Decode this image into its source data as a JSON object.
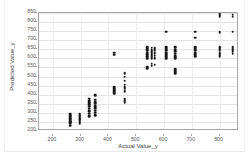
{
  "chart_data": {
    "type": "scatter",
    "title": "",
    "xlabel": "Actual Value_y",
    "ylabel": "Predicted Value_y",
    "xlim": [
      150,
      870
    ],
    "ylim": [
      200,
      850
    ],
    "xticks": [
      200,
      300,
      400,
      500,
      600,
      700,
      800
    ],
    "yticks": [
      200,
      250,
      300,
      350,
      400,
      450,
      500,
      550,
      600,
      650,
      700,
      750,
      800,
      850
    ],
    "grid": true,
    "legend": null,
    "marker": "filled-circle",
    "marker_color": "#181818",
    "points": [
      [
        262,
        230
      ],
      [
        262,
        240
      ],
      [
        262,
        248
      ],
      [
        262,
        255
      ],
      [
        262,
        262
      ],
      [
        262,
        270
      ],
      [
        262,
        278
      ],
      [
        262,
        285
      ],
      [
        262,
        292
      ],
      [
        297,
        240
      ],
      [
        297,
        250
      ],
      [
        297,
        258
      ],
      [
        297,
        265
      ],
      [
        297,
        272
      ],
      [
        297,
        280
      ],
      [
        297,
        288
      ],
      [
        297,
        295
      ],
      [
        331,
        280
      ],
      [
        331,
        295
      ],
      [
        331,
        310
      ],
      [
        331,
        322
      ],
      [
        331,
        335
      ],
      [
        331,
        348
      ],
      [
        331,
        358
      ],
      [
        331,
        368
      ],
      [
        331,
        378
      ],
      [
        352,
        288
      ],
      [
        352,
        300
      ],
      [
        352,
        312
      ],
      [
        352,
        325
      ],
      [
        352,
        338
      ],
      [
        352,
        350
      ],
      [
        352,
        360
      ],
      [
        352,
        372
      ],
      [
        352,
        398
      ],
      [
        421,
        405
      ],
      [
        421,
        415
      ],
      [
        421,
        425
      ],
      [
        421,
        432
      ],
      [
        421,
        440
      ],
      [
        421,
        620
      ],
      [
        421,
        632
      ],
      [
        458,
        355
      ],
      [
        458,
        365
      ],
      [
        458,
        375
      ],
      [
        458,
        420
      ],
      [
        458,
        432
      ],
      [
        458,
        442
      ],
      [
        458,
        455
      ],
      [
        458,
        478
      ],
      [
        458,
        498
      ],
      [
        458,
        518
      ],
      [
        540,
        545
      ],
      [
        540,
        555
      ],
      [
        540,
        600
      ],
      [
        540,
        612
      ],
      [
        540,
        622
      ],
      [
        540,
        632
      ],
      [
        540,
        642
      ],
      [
        540,
        652
      ],
      [
        540,
        660
      ],
      [
        556,
        560
      ],
      [
        556,
        570
      ],
      [
        556,
        598
      ],
      [
        556,
        608
      ],
      [
        556,
        618
      ],
      [
        556,
        628
      ],
      [
        556,
        638
      ],
      [
        556,
        648
      ],
      [
        556,
        658
      ],
      [
        567,
        565
      ],
      [
        567,
        600
      ],
      [
        567,
        615
      ],
      [
        567,
        630
      ],
      [
        567,
        645
      ],
      [
        567,
        655
      ],
      [
        608,
        600
      ],
      [
        608,
        612
      ],
      [
        608,
        622
      ],
      [
        608,
        632
      ],
      [
        608,
        642
      ],
      [
        608,
        652
      ],
      [
        608,
        660
      ],
      [
        608,
        748
      ],
      [
        640,
        518
      ],
      [
        640,
        530
      ],
      [
        640,
        540
      ],
      [
        640,
        600
      ],
      [
        640,
        612
      ],
      [
        640,
        625
      ],
      [
        640,
        638
      ],
      [
        640,
        648
      ],
      [
        640,
        658
      ],
      [
        640,
        665
      ],
      [
        712,
        612
      ],
      [
        712,
        622
      ],
      [
        712,
        632
      ],
      [
        712,
        642
      ],
      [
        712,
        652
      ],
      [
        712,
        660
      ],
      [
        712,
        715
      ],
      [
        712,
        748
      ],
      [
        800,
        612
      ],
      [
        800,
        622
      ],
      [
        800,
        632
      ],
      [
        800,
        645
      ],
      [
        800,
        655
      ],
      [
        800,
        662
      ],
      [
        800,
        745
      ],
      [
        800,
        832
      ],
      [
        800,
        842
      ],
      [
        848,
        625
      ],
      [
        848,
        638
      ],
      [
        848,
        650
      ],
      [
        848,
        660
      ],
      [
        848,
        748
      ],
      [
        848,
        830
      ],
      [
        848,
        840
      ]
    ]
  }
}
